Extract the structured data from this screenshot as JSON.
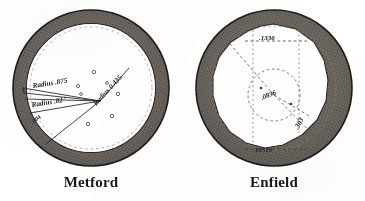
{
  "sheet": {
    "title": "Rifling cross-sections",
    "background_color": "#ffffff",
    "ink_color": "#1d1d1d",
    "annulus_color": "#6e6a66",
    "annulus_edge_color": "#2a2724"
  },
  "panels": [
    {
      "id": "metford",
      "caption": "Metford",
      "bore_description": "Metford segmental rifling bore cross-section",
      "annulus": {
        "outer_radius": 78,
        "inner_radius": 64,
        "fill": "#6e6a66",
        "texture": "stipple"
      },
      "annotations": [
        {
          "name": "radius-upper",
          "text": "Radius .875",
          "rotation": -9
        },
        {
          "name": "radius-lower",
          "text": "Radius .82\"",
          "rotation": -9
        },
        {
          "name": "radius-right",
          "text": "Radius 0.435",
          "rotation": -47
        },
        {
          "name": "angle-mark",
          "text": ".004",
          "rotation": -38
        }
      ],
      "groove_dots": 7
    },
    {
      "id": "enfield",
      "caption": "Enfield",
      "bore_description": "Enfield polygonal rifling bore cross-section",
      "annulus": {
        "outer_radius": 78,
        "inner_radius": 64,
        "fill": "#6e6a66",
        "texture": "stipple"
      },
      "annotations": [
        {
          "name": "dimension-top",
          "text": ".1336",
          "rotation": 0
        },
        {
          "name": "dimension-center",
          "text": ".0836",
          "rotation": -22
        },
        {
          "name": "dimension-bottom",
          "text": ".10519",
          "rotation": 0
        },
        {
          "name": "dimension-diagonal",
          "text": ".303",
          "rotation": -62
        }
      ],
      "construction": {
        "vertical_guides": 2,
        "inner_circle_radius": 26,
        "dashed_bore_radius": 62
      }
    }
  ]
}
